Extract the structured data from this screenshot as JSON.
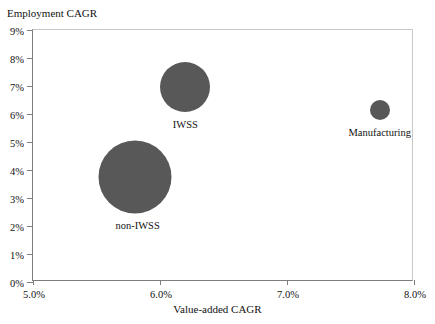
{
  "chart_data": {
    "type": "scatter",
    "title": "",
    "xlabel": "Value-added CAGR",
    "ylabel": "Employment CAGR",
    "xlim": [
      5.0,
      8.0
    ],
    "ylim": [
      0,
      9
    ],
    "grid": false,
    "legend": "none",
    "x_ticks": [
      "5.0%",
      "6.0%",
      "7.0%",
      "8.0%"
    ],
    "x_tick_values": [
      5.0,
      6.0,
      7.0,
      8.0
    ],
    "y_ticks": [
      "0%",
      "1%",
      "2%",
      "3%",
      "4%",
      "5%",
      "6%",
      "7%",
      "8%",
      "9%"
    ],
    "y_tick_values": [
      0,
      1,
      2,
      3,
      4,
      5,
      6,
      7,
      8,
      9
    ],
    "bubble_color": "#585858",
    "points": [
      {
        "label": "non-IWSS",
        "x": 5.8,
        "y": 3.75,
        "size_px": 73,
        "label_dx": 3,
        "label_dy": 43
      },
      {
        "label": "IWSS",
        "x": 6.2,
        "y": 6.95,
        "size_px": 50,
        "label_dx": 0,
        "label_dy": 32
      },
      {
        "label": "Manufacturing",
        "x": 7.73,
        "y": 6.15,
        "size_px": 20,
        "label_dx": 0,
        "label_dy": 17
      }
    ]
  },
  "axes": {
    "y_title": "Employment CAGR",
    "x_title": "Value-added CAGR"
  }
}
